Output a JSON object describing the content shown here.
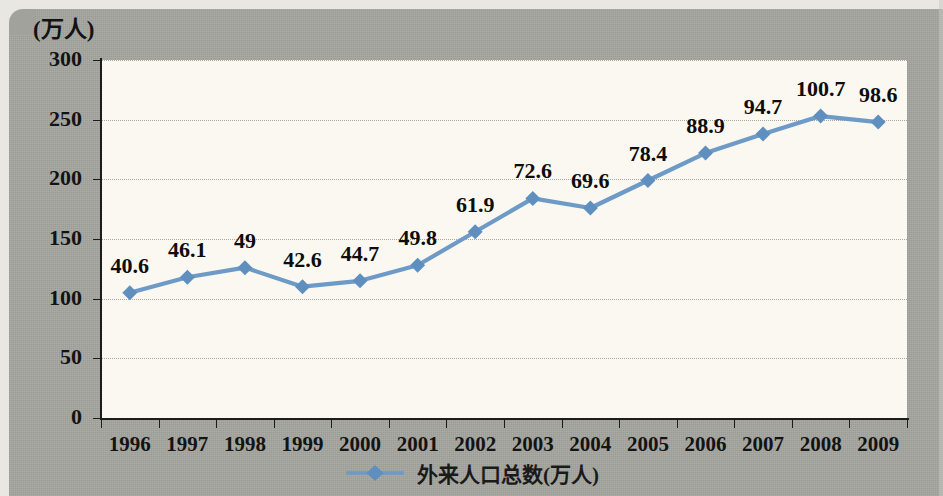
{
  "chart_data": {
    "type": "line",
    "title": "",
    "xlabel": "",
    "ylabel": "(万人)",
    "y_unit_label": "(万人)",
    "categories": [
      "1996",
      "1997",
      "1998",
      "1999",
      "2000",
      "2001",
      "2002",
      "2003",
      "2004",
      "2005",
      "2006",
      "2007",
      "2008",
      "2009"
    ],
    "data_labels": [
      "40.6",
      "46.1",
      "49",
      "42.6",
      "44.7",
      "49.8",
      "61.9",
      "72.6",
      "69.6",
      "78.4",
      "88.9",
      "94.7",
      "100.7",
      "98.6"
    ],
    "values": [
      40.6,
      46.1,
      49,
      42.6,
      44.7,
      49.8,
      61.9,
      72.6,
      69.6,
      78.4,
      88.9,
      94.7,
      100.7,
      98.6
    ],
    "plotted_values": [
      105,
      118,
      126,
      110,
      115,
      128,
      156,
      184,
      176,
      199,
      222,
      238,
      253,
      248
    ],
    "ylim": [
      0,
      300
    ],
    "y_ticks": [
      "0",
      "50",
      "100",
      "150",
      "200",
      "250",
      "300"
    ],
    "y_tick_values": [
      0,
      50,
      100,
      150,
      200,
      250,
      300
    ],
    "grid": true,
    "grid_orientation": "horizontal",
    "legend": {
      "position": "bottom-center",
      "entries": [
        {
          "label": "外来人口总数(万人)",
          "marker": "diamond",
          "color": "#6d9ac6"
        }
      ]
    },
    "series": [
      {
        "name": "外来人口总数(万人)",
        "color": "#6d9ac6",
        "marker": "diamond",
        "values": [
          40.6,
          46.1,
          49,
          42.6,
          44.7,
          49.8,
          61.9,
          72.6,
          69.6,
          78.4,
          88.9,
          94.7,
          100.7,
          98.6
        ]
      }
    ]
  },
  "colors": {
    "series_blue": "#6d9ac6",
    "marker_blue": "#5f8fbe",
    "plot_background": "#faf8f0",
    "page_background": "#a2a29c",
    "axis_black": "#1c1c1c",
    "gridline": "#9a988f",
    "text": "#131313"
  },
  "watermark": {
    "line1": "",
    "line2": ""
  }
}
